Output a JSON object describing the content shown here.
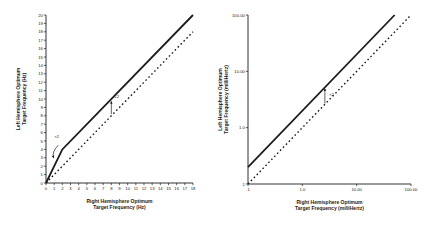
{
  "page": {
    "background": "#ffffff",
    "ink_color": "#1c1c1c"
  },
  "chart_data": [
    {
      "id": "hz-chart",
      "type": "line",
      "title": "",
      "xlabel": [
        "Right Hemisphere Optimum",
        "Target Frequency (Hz)"
      ],
      "ylabel": [
        "Left Hemisphere Optimum",
        "Target Frequency (Hz)"
      ],
      "x_scale": "linear",
      "y_scale": "linear",
      "xlim": [
        0,
        18
      ],
      "ylim": [
        0,
        20
      ],
      "grid": false,
      "legend": "none",
      "x_ticks": [
        0,
        1,
        2,
        3,
        4,
        5,
        6,
        7,
        8,
        9,
        10,
        11,
        12,
        13,
        14,
        15,
        16,
        17,
        18
      ],
      "y_ticks": [
        0,
        1,
        2,
        3,
        4,
        5,
        6,
        7,
        8,
        9,
        10,
        11,
        12,
        13,
        14,
        15,
        16,
        17,
        18,
        19,
        20
      ],
      "series": [
        {
          "name": "left-optimum-rule-solid",
          "line_style": "solid",
          "color": "#1c1c1c",
          "points": [
            [
              0,
              0
            ],
            [
              2,
              4
            ],
            [
              18,
              20
            ]
          ]
        },
        {
          "name": "identity-line-dashed",
          "line_style": "dashed",
          "color": "#1c1c1c",
          "points": [
            [
              0,
              0
            ],
            [
              18,
              18
            ]
          ]
        }
      ],
      "annotations": [
        {
          "text": "×2",
          "text_xy": [
            1.0,
            5.4
          ],
          "arrow_from": [
            1.5,
            4.5
          ],
          "arrow_to": [
            0.95,
            3.0
          ],
          "curved": true
        },
        {
          "text": "+2",
          "text_xy": [
            8.35,
            10.1
          ],
          "arrow_from": [
            8,
            8.2
          ],
          "arrow_to": [
            8,
            9.7
          ],
          "curved": false
        }
      ]
    },
    {
      "id": "millihertz-chart",
      "type": "line",
      "title": "",
      "xlabel": [
        "Right Hemisphere Optimum",
        "Target Frequency (milliHertz)"
      ],
      "ylabel": [
        "Left Hemisphere Optimum",
        "Target Frequency (milliHertz)"
      ],
      "x_scale": "log",
      "y_scale": "log",
      "xlim": [
        0.1,
        100
      ],
      "ylim": [
        0.1,
        100
      ],
      "grid": false,
      "legend": "none",
      "x_ticks": [
        0.1,
        1,
        10,
        100
      ],
      "y_ticks": [
        0.1,
        1,
        10,
        100
      ],
      "x_tick_labels": [
        ".1",
        "1.0",
        "10.00",
        "100.00"
      ],
      "y_tick_labels": [
        ".1",
        "1.0",
        "10.00",
        "100.00"
      ],
      "series": [
        {
          "name": "left-equals-twice-right-solid",
          "line_style": "solid",
          "color": "#1c1c1c",
          "points": [
            [
              0.1,
              0.2
            ],
            [
              50,
              100
            ]
          ]
        },
        {
          "name": "identity-line-dashed",
          "line_style": "dashed",
          "color": "#1c1c1c",
          "points": [
            [
              0.1,
              0.1
            ],
            [
              100,
              100
            ]
          ]
        }
      ],
      "annotations": [
        {
          "text": "×2",
          "text_xy": [
            3.1,
            3.6
          ],
          "arrow_from": [
            2.6,
            2.7
          ],
          "arrow_to": [
            2.6,
            4.9
          ],
          "curved": false
        }
      ]
    }
  ]
}
